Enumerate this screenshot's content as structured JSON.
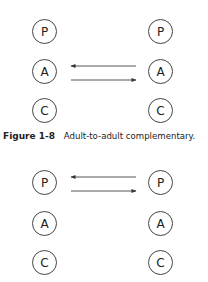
{
  "diagrams": [
    {
      "left_column": [
        "P",
        "A",
        "C"
      ],
      "right_column": [
        "P",
        "A",
        "C"
      ],
      "transaction_level": "A",
      "arrows": [
        {
          "from": "right-A",
          "to": "left-A",
          "direction": "left"
        },
        {
          "from": "left-A",
          "to": "right-A",
          "direction": "right"
        }
      ]
    },
    {
      "left_column": [
        "P",
        "A",
        "C"
      ],
      "right_column": [
        "P",
        "A",
        "C"
      ],
      "transaction_level": "P",
      "arrows": [
        {
          "from": "right-P",
          "to": "left-P",
          "direction": "left"
        },
        {
          "from": "left-P",
          "to": "right-P",
          "direction": "right"
        }
      ]
    }
  ],
  "caption": {
    "figure_label": "Figure 1-8",
    "text": "Adult-to-adult complementary."
  },
  "colors": {
    "stroke": "#444444",
    "text": "#222222",
    "background": "#ffffff"
  }
}
